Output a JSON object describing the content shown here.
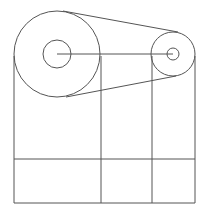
{
  "diagram": {
    "title": "",
    "stroke_color": "#555555",
    "background": "#ffffff",
    "large_pulley": {
      "cx": 57,
      "cy": 54,
      "r_outer": 43,
      "r_inner": 14
    },
    "small_pulley": {
      "cx": 173,
      "cy": 54,
      "r_outer": 22,
      "r_inner": 6
    },
    "center_line": {
      "x1": 57,
      "y1": 54,
      "x2": 173,
      "y2": 54
    },
    "belt": {
      "top": {
        "x1": 63,
        "y1": 10,
        "x2": 178,
        "y2": 32
      },
      "bottom": {
        "x1": 66,
        "y1": 98,
        "x2": 177,
        "y2": 76
      }
    },
    "verticals": [
      14,
      101,
      152,
      195
    ],
    "vertical_top": 54,
    "horizontal_mid": 159,
    "bottom": 203
  }
}
